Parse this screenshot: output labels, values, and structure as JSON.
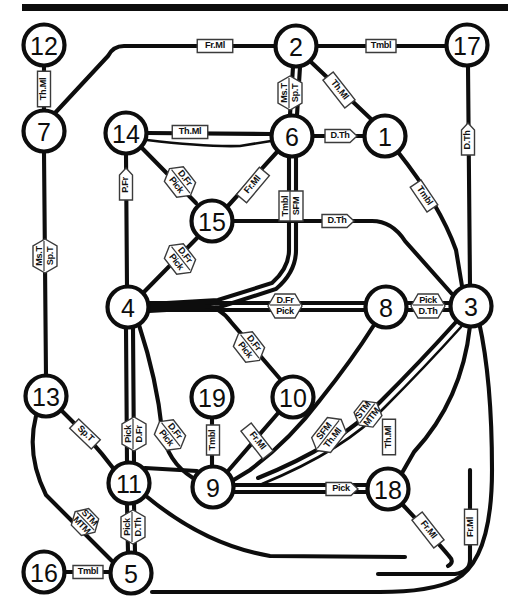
{
  "figure": {
    "type": "node-link-diagram",
    "title": "",
    "top_rule": true,
    "node_shape": "circle",
    "node_count": 19,
    "colors": {
      "ink": "#0d0d0d",
      "background": "#ffffff",
      "plate_fill": "#ffffff",
      "plate_stroke": "#3b3b3b"
    }
  },
  "nodes": [
    {
      "id": "1",
      "label": "1",
      "x": 385,
      "y": 136
    },
    {
      "id": "2",
      "label": "2",
      "x": 296,
      "y": 46
    },
    {
      "id": "3",
      "label": "3",
      "x": 471,
      "y": 306
    },
    {
      "id": "4",
      "label": "4",
      "x": 128,
      "y": 307
    },
    {
      "id": "5",
      "label": "5",
      "x": 131,
      "y": 573
    },
    {
      "id": "6",
      "label": "6",
      "x": 292,
      "y": 136
    },
    {
      "id": "7",
      "label": "7",
      "x": 44,
      "y": 131
    },
    {
      "id": "8",
      "label": "8",
      "x": 386,
      "y": 307
    },
    {
      "id": "9",
      "label": "9",
      "x": 213,
      "y": 487
    },
    {
      "id": "10",
      "label": "10",
      "x": 293,
      "y": 397
    },
    {
      "id": "11",
      "label": "11",
      "x": 129,
      "y": 483
    },
    {
      "id": "12",
      "label": "12",
      "x": 44,
      "y": 45
    },
    {
      "id": "13",
      "label": "13",
      "x": 46,
      "y": 396
    },
    {
      "id": "14",
      "label": "14",
      "x": 126,
      "y": 133
    },
    {
      "id": "15",
      "label": "15",
      "x": 212,
      "y": 221
    },
    {
      "id": "16",
      "label": "16",
      "x": 44,
      "y": 572
    },
    {
      "id": "17",
      "label": "17",
      "x": 467,
      "y": 45
    },
    {
      "id": "18",
      "label": "18",
      "x": 388,
      "y": 489
    },
    {
      "id": "19",
      "label": "19",
      "x": 212,
      "y": 397
    }
  ],
  "edge_labels": [
    {
      "id": "l-12-7",
      "lines": [
        "Th.Ml"
      ],
      "x": 44,
      "y": 89,
      "rot": -90,
      "arrow": "none"
    },
    {
      "id": "l-7-2",
      "lines": [
        "Fr.Ml"
      ],
      "x": 215,
      "y": 46,
      "rot": 0,
      "arrow": "none"
    },
    {
      "id": "l-2-17",
      "lines": [
        "Tmbl"
      ],
      "x": 381,
      "y": 46,
      "rot": 0,
      "arrow": "none"
    },
    {
      "id": "l-2-6",
      "lines": [
        "Ms.T",
        "Sp.T"
      ],
      "x": 290,
      "y": 93,
      "rot": -90,
      "arrow": "both-split"
    },
    {
      "id": "l-2-1",
      "lines": [
        "Th.Ml"
      ],
      "x": 339,
      "y": 90,
      "rot": 52,
      "arrow": "none"
    },
    {
      "id": "l-14-6",
      "lines": [
        "Th.Ml"
      ],
      "x": 190,
      "y": 132,
      "rot": 0,
      "arrow": "none"
    },
    {
      "id": "l-6-1",
      "lines": [
        "D.Th"
      ],
      "x": 340,
      "y": 136,
      "rot": 0,
      "arrow": "right"
    },
    {
      "id": "l-17-3",
      "lines": [
        "D.Th"
      ],
      "x": 468,
      "y": 140,
      "rot": -90,
      "arrow": "down"
    },
    {
      "id": "l-14-4",
      "lines": [
        "P.Fr"
      ],
      "x": 126,
      "y": 185,
      "rot": -90,
      "arrow": "down"
    },
    {
      "id": "l-14-15",
      "lines": [
        "D.Fr",
        "Pick"
      ],
      "x": 180,
      "y": 182,
      "rot": 52,
      "arrow": "both-split"
    },
    {
      "id": "l-6-15",
      "lines": [
        "Fr.Ml"
      ],
      "x": 253,
      "y": 185,
      "rot": -50,
      "arrow": "none"
    },
    {
      "id": "l-6-4",
      "lines": [
        "Tmbl",
        "SFM"
      ],
      "x": 291,
      "y": 206,
      "rot": -90,
      "arrow": "none"
    },
    {
      "id": "l-15-8",
      "lines": [
        "D.Th"
      ],
      "x": 337,
      "y": 221,
      "rot": 0,
      "arrow": "right"
    },
    {
      "id": "l-15-4",
      "lines": [
        "D.Fr",
        "Pick"
      ],
      "x": 180,
      "y": 259,
      "rot": 52,
      "arrow": "both-split"
    },
    {
      "id": "l-1-3",
      "lines": [
        "Tmbl"
      ],
      "x": 424,
      "y": 196,
      "rot": 56,
      "arrow": "none"
    },
    {
      "id": "l-4-8",
      "lines": [
        "D.Fr",
        "Pick"
      ],
      "x": 285,
      "y": 306,
      "rot": 0,
      "arrow": "both-split"
    },
    {
      "id": "l-8-3",
      "lines": [
        "Pick",
        "D.Th"
      ],
      "x": 428,
      "y": 306,
      "rot": 0,
      "arrow": "both-rows"
    },
    {
      "id": "l-4-10",
      "lines": [
        "D.Fr",
        "Pick"
      ],
      "x": 249,
      "y": 347,
      "rot": 52,
      "arrow": "both-split"
    },
    {
      "id": "l-7-13",
      "lines": [
        "Ms.T",
        "Sp.T"
      ],
      "x": 45,
      "y": 256,
      "rot": -90,
      "arrow": "both-split"
    },
    {
      "id": "l-4-11",
      "lines": [
        "Pick",
        "D.Fr"
      ],
      "x": 134,
      "y": 434,
      "rot": -90,
      "arrow": "both-split"
    },
    {
      "id": "l-11-9",
      "lines": [
        "D.Fr",
        "Pick"
      ],
      "x": 170,
      "y": 435,
      "rot": 52,
      "arrow": "both-split"
    },
    {
      "id": "l-19-9",
      "lines": [
        "Tmbl"
      ],
      "x": 213,
      "y": 440,
      "rot": -90,
      "arrow": "none"
    },
    {
      "id": "l-10-9",
      "lines": [
        "Fr.Ml"
      ],
      "x": 257,
      "y": 441,
      "rot": 52,
      "arrow": "none"
    },
    {
      "id": "l-13-11",
      "lines": [
        "Sp.T"
      ],
      "x": 85,
      "y": 434,
      "rot": 44,
      "arrow": "none"
    },
    {
      "id": "l-13-5",
      "lines": [
        "STM",
        "MTM"
      ],
      "x": 85,
      "y": 522,
      "rot": 46,
      "arrow": "both-split"
    },
    {
      "id": "l-11-5",
      "lines": [
        "Pick",
        "D.Th"
      ],
      "x": 133,
      "y": 527,
      "rot": -90,
      "arrow": "both-split"
    },
    {
      "id": "l-16-5",
      "lines": [
        "Tmbl"
      ],
      "x": 88,
      "y": 572,
      "rot": 0,
      "arrow": "none"
    },
    {
      "id": "l-9-18",
      "lines": [
        "Pick"
      ],
      "x": 341,
      "y": 489,
      "rot": 0,
      "arrow": "right"
    },
    {
      "id": "l-8-9",
      "lines": [
        "SFM",
        "Th.Ml"
      ],
      "x": 329,
      "y": 435,
      "rot": -52,
      "arrow": "both-split"
    },
    {
      "id": "l-3-9",
      "lines": [
        "STM",
        "MTM"
      ],
      "x": 368,
      "y": 414,
      "rot": -52,
      "arrow": "both-split"
    },
    {
      "id": "l-3-18",
      "lines": [
        "Th.Ml"
      ],
      "x": 389,
      "y": 437,
      "rot": -90,
      "arrow": "none"
    },
    {
      "id": "l-18-5",
      "lines": [
        "Fr.Ml"
      ],
      "x": 428,
      "y": 530,
      "rot": 52,
      "arrow": "none"
    },
    {
      "id": "l-3-5",
      "lines": [
        "Fr.Ml"
      ],
      "x": 471,
      "y": 527,
      "rot": -90,
      "arrow": "none"
    }
  ],
  "edges": [
    {
      "from": "12",
      "to": "7",
      "label": "Th.Ml"
    },
    {
      "from": "7",
      "to": "2",
      "label": "Fr.Ml"
    },
    {
      "from": "2",
      "to": "17",
      "label": "Tmbl"
    },
    {
      "from": "2",
      "to": "6",
      "label": "Ms.T / Sp.T"
    },
    {
      "from": "2",
      "to": "1",
      "label": "Th.Ml"
    },
    {
      "from": "14",
      "to": "6",
      "label": "Th.Ml"
    },
    {
      "from": "6",
      "to": "1",
      "label": "D.Th"
    },
    {
      "from": "17",
      "to": "3",
      "label": "D.Th"
    },
    {
      "from": "14",
      "to": "4",
      "label": "P.Fr"
    },
    {
      "from": "14",
      "to": "15",
      "label": "D.Fr / Pick"
    },
    {
      "from": "6",
      "to": "15",
      "label": "Fr.Ml"
    },
    {
      "from": "6",
      "to": "4",
      "label": "Tmbl / SFM"
    },
    {
      "from": "15",
      "to": "8",
      "label": "D.Th"
    },
    {
      "from": "15",
      "to": "4",
      "label": "D.Fr / Pick"
    },
    {
      "from": "1",
      "to": "3",
      "label": "Tmbl"
    },
    {
      "from": "4",
      "to": "8",
      "label": "D.Fr / Pick"
    },
    {
      "from": "8",
      "to": "3",
      "label": "Pick / D.Th"
    },
    {
      "from": "4",
      "to": "10",
      "label": "D.Fr / Pick"
    },
    {
      "from": "7",
      "to": "13",
      "label": "Ms.T / Sp.T"
    },
    {
      "from": "4",
      "to": "11",
      "label": "Pick / D.Fr"
    },
    {
      "from": "11",
      "to": "9",
      "label": "D.Fr / Pick"
    },
    {
      "from": "19",
      "to": "9",
      "label": "Tmbl"
    },
    {
      "from": "10",
      "to": "9",
      "label": "Fr.Ml"
    },
    {
      "from": "13",
      "to": "11",
      "label": "Sp.T"
    },
    {
      "from": "13",
      "to": "5",
      "label": "STM / MTM"
    },
    {
      "from": "11",
      "to": "5",
      "label": "Pick / D.Th"
    },
    {
      "from": "16",
      "to": "5",
      "label": "Tmbl"
    },
    {
      "from": "9",
      "to": "18",
      "label": "Pick"
    },
    {
      "from": "8",
      "to": "9",
      "label": "SFM / Th.Ml"
    },
    {
      "from": "3",
      "to": "9",
      "label": "STM / MTM"
    },
    {
      "from": "3",
      "to": "18",
      "label": "Th.Ml"
    },
    {
      "from": "18",
      "to": "5",
      "label": "Fr.Ml"
    },
    {
      "from": "3",
      "to": "5",
      "label": "Fr.Ml"
    }
  ]
}
